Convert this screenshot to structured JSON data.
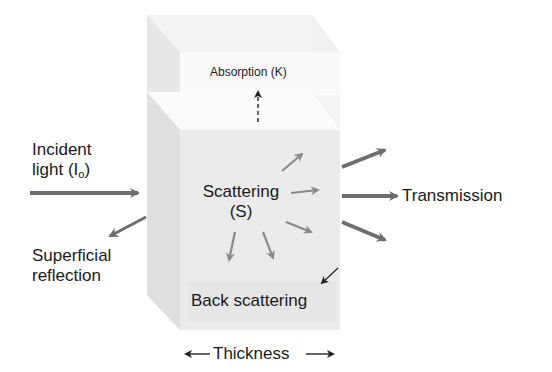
{
  "diagram": {
    "labels": {
      "absorption": "Absorption (K)",
      "incident_line1": "Incident",
      "incident_line2_prefix": "light (I",
      "incident_subscript": "o",
      "incident_line2_suffix": ")",
      "superficial_line1": "Superficial",
      "superficial_line2": "reflection",
      "scattering_line1": "Scattering",
      "scattering_line2": "(S)",
      "back_scattering": "Back scattering",
      "transmission": "Transmission",
      "thickness": "Thickness"
    },
    "colors": {
      "arrow_gray": "#6e6e6e",
      "arrow_light": "#8a8a8a",
      "block_fill": "#ececec",
      "block_top": "#f7f7f7",
      "block_side": "#e2e2e2",
      "text": "#1a1a1a"
    }
  }
}
